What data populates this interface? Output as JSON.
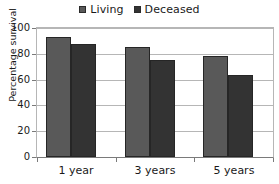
{
  "chart_data": {
    "type": "bar",
    "title": "",
    "xlabel": "",
    "ylabel": "Percentage survival",
    "categories": [
      "1 year",
      "3 years",
      "5 years"
    ],
    "series": [
      {
        "name": "Living",
        "color": "#595959",
        "values": [
          94,
          86,
          79
        ]
      },
      {
        "name": "Deceased",
        "color": "#333333",
        "values": [
          88,
          76,
          64
        ]
      }
    ],
    "ylim": [
      0,
      100
    ],
    "ytick_values": [
      0,
      20,
      40,
      60,
      80,
      100
    ],
    "ytick_labels": [
      "0",
      "20",
      "40",
      "60",
      "80",
      "100"
    ],
    "grid": "horizontal",
    "legend_position": "top-center",
    "legend_entries": [
      "Living",
      "Deceased"
    ]
  },
  "legend": {
    "items": [
      {
        "label": "Living",
        "swatch_name": "legend-swatch-living"
      },
      {
        "label": "Deceased",
        "swatch_name": "legend-swatch-deceased"
      }
    ]
  },
  "axes": {
    "y_title": "Percentage survival",
    "y_ticks": [
      "100",
      "80",
      "60",
      "40",
      "20",
      "0"
    ],
    "x_ticks": [
      "1 year",
      "3 years",
      "5 years"
    ]
  },
  "colors": {
    "living": "#595959",
    "deceased": "#333333",
    "gridline": "#b6b6b6",
    "axis": "#7a7a7a",
    "text": "#1a1a1a",
    "background": "#ffffff"
  }
}
